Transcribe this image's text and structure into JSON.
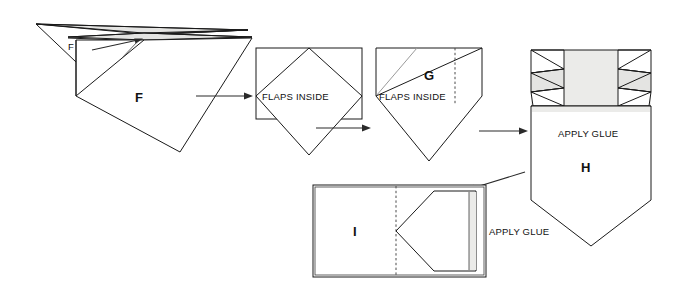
{
  "diagram": {
    "colors": {
      "ink": "#1a1a1a",
      "shade": "#e4e4e2",
      "dashed_fold": "#4a4a4a",
      "background": "#ffffff"
    },
    "steps": [
      {
        "id": "F",
        "label": "F",
        "callout": "F",
        "notes": []
      },
      {
        "id": "F2",
        "label": "",
        "notes": [
          {
            "text": "FLAPS INSIDE"
          }
        ]
      },
      {
        "id": "G",
        "label": "G",
        "notes": [
          {
            "text": "FLAPS INSIDE"
          }
        ]
      },
      {
        "id": "H",
        "label": "H",
        "notes": [
          {
            "text": "APPLY GLUE"
          }
        ]
      },
      {
        "id": "I",
        "label": "I",
        "notes": [
          {
            "text": "APPLY GLUE"
          }
        ]
      }
    ],
    "labels": {
      "step_f": "F",
      "callout_f": "F",
      "flaps_inside_1": "FLAPS INSIDE",
      "step_g": "G",
      "flaps_inside_2": "FLAPS INSIDE",
      "apply_glue_h": "APPLY GLUE",
      "step_h": "H",
      "step_i": "I",
      "apply_glue_i": "APPLY GLUE"
    },
    "arrows": [
      {
        "name": "arrow-f-to-flaps",
        "from": "F",
        "to": "FLAPS INSIDE"
      },
      {
        "name": "arrow-flaps-to-g",
        "from": "FLAPS INSIDE",
        "to": "G"
      },
      {
        "name": "arrow-g-to-h",
        "from": "G",
        "to": "H"
      },
      {
        "name": "arrow-h-to-i",
        "from": "H",
        "to": "I"
      },
      {
        "name": "arrow-callout-f",
        "from": "F label",
        "to": "fold apex"
      }
    ]
  }
}
